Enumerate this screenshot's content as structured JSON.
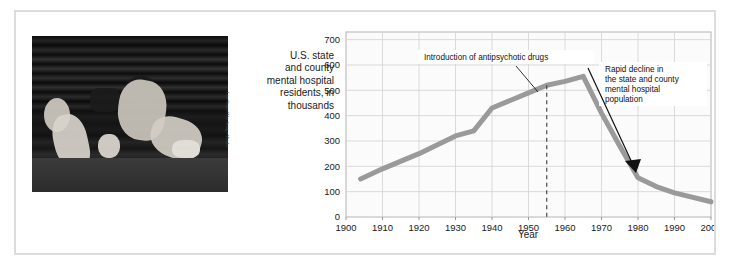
{
  "figure": {
    "photo": {
      "alt_name": "homeless-people-sleeping-on-sidewalk",
      "credit": "Les Stone/The Image Works"
    },
    "axis_title": [
      "U.S. state",
      "and county",
      "mental hospital",
      "residents, in",
      "thousands"
    ]
  },
  "chart_data": {
    "type": "line",
    "title": "",
    "xlabel": "Year",
    "ylabel": "U.S. state and county mental hospital residents, in thousands",
    "xlim": [
      1900,
      2000
    ],
    "ylim": [
      0,
      730
    ],
    "yticks": [
      0,
      100,
      200,
      300,
      400,
      500,
      600,
      700
    ],
    "xticks": [
      1900,
      1910,
      1920,
      1930,
      1940,
      1950,
      1960,
      1970,
      1980,
      1990,
      2000
    ],
    "grid": true,
    "legend": "none",
    "line_color": "#9a9a9a",
    "series": [
      {
        "name": "Mental hospital residents",
        "x": [
          1904,
          1910,
          1920,
          1930,
          1935,
          1940,
          1950,
          1955,
          1960,
          1965,
          1970,
          1975,
          1980,
          1985,
          1990,
          2000
        ],
        "values": [
          150,
          190,
          250,
          320,
          340,
          430,
          490,
          520,
          535,
          555,
          410,
          280,
          155,
          120,
          95,
          60
        ]
      }
    ],
    "annotations": [
      {
        "name": "introduction-of-antipsychotic-drugs",
        "text": "Introduction of antipsychotic drugs",
        "marker_year": 1955,
        "marker_style": "dashed-vertical-line"
      },
      {
        "name": "rapid-decline",
        "text": [
          "Rapid decline in",
          "the state and county",
          "mental hospital",
          "population"
        ],
        "marker_style": "arrow"
      }
    ]
  }
}
